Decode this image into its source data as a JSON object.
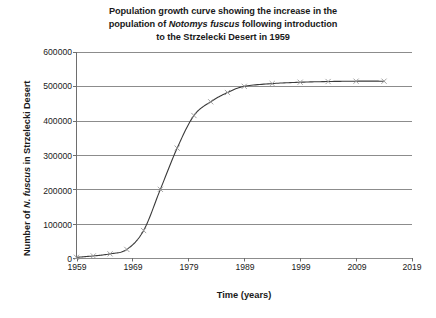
{
  "chart_data": {
    "type": "line",
    "title": "Population growth curve showing the increase in the population of Notomys fuscus following introduction to the Strzelecki Desert in 1959",
    "title_lines": [
      {
        "pre": "Population growth curve showing the increase in the",
        "italic": "",
        "post": ""
      },
      {
        "pre": "population of ",
        "italic": "Notomys fuscus",
        "post": " following introduction"
      },
      {
        "pre": "to the Strzelecki Desert in 1959",
        "italic": "",
        "post": ""
      }
    ],
    "xlabel": "Time (years)",
    "ylabel": "Number of N. fuscus in Strzelecki Desert",
    "ylabel_parts": {
      "pre": "Number of ",
      "italic": "N. fuscus",
      "post": " in Strzelecki Desert"
    },
    "xlim": [
      1959,
      2019
    ],
    "ylim": [
      0,
      600000
    ],
    "xticks": [
      1959,
      1969,
      1979,
      1989,
      1999,
      2009,
      2019
    ],
    "xtick_labels": [
      "1959",
      "1969",
      "1979",
      "1989",
      "1999",
      "2009",
      "2019"
    ],
    "yticks": [
      0,
      100000,
      200000,
      300000,
      400000,
      500000,
      600000
    ],
    "ytick_labels": [
      "0",
      "100000",
      "200000",
      "300000",
      "400000",
      "500000",
      "600000"
    ],
    "grid": "horizontal",
    "legend": "none",
    "marker": "x",
    "series": [
      {
        "name": "Notomys fuscus population",
        "x": [
          1959,
          1962,
          1965,
          1968,
          1971,
          1974,
          1977,
          1980,
          1983,
          1986,
          1989,
          1994,
          1999,
          2004,
          2009,
          2014
        ],
        "values": [
          2000,
          6000,
          12000,
          25000,
          80000,
          200000,
          320000,
          415000,
          455000,
          482000,
          500000,
          508000,
          512000,
          514000,
          515000,
          515000
        ]
      }
    ],
    "colors": {
      "line": "#3a3a3a",
      "marker": "#9a9a9a",
      "grid": "#8c8c8c",
      "axis": "#6e6e6e",
      "text": "#1a1a1a",
      "background": "#ffffff"
    }
  }
}
